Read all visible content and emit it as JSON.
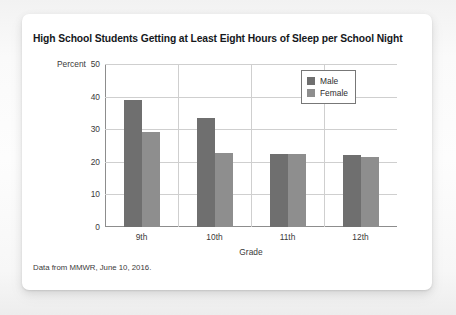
{
  "card": {
    "title": "High School Students Getting at Least Eight Hours of Sleep per School Night",
    "source_note": "Data from MMWR, June 10, 2016."
  },
  "colors": {
    "male": "#6f6f6f",
    "female": "#8e8e8e",
    "gridline": "#cfcfcf",
    "axis": "#8d8d8d",
    "card_background": "#ffffff"
  },
  "chart_data": {
    "type": "bar",
    "title": "High School Students Getting at Least Eight Hours of Sleep per School Night",
    "xlabel": "Grade",
    "ylabel": "Percent",
    "categories": [
      "9th",
      "10th",
      "11th",
      "12th"
    ],
    "series": [
      {
        "name": "Male",
        "values": [
          39.0,
          33.5,
          22.4,
          22.2
        ]
      },
      {
        "name": "Female",
        "values": [
          29.0,
          22.7,
          22.3,
          21.4
        ]
      }
    ],
    "ylim": [
      0,
      50
    ],
    "yticks": [
      0,
      10,
      20,
      30,
      40,
      50
    ],
    "ytick_labels": [
      "0",
      "10",
      "20",
      "30",
      "40",
      "50"
    ],
    "grid": "horizontal-and-vertical",
    "legend_position": "top-right",
    "legend_entries": [
      "Male",
      "Female"
    ]
  }
}
